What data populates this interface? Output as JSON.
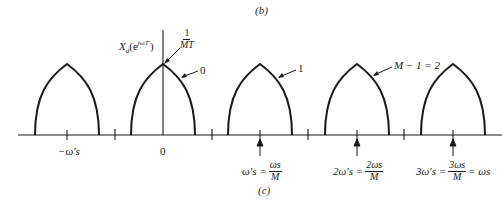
{
  "figure": {
    "top_caption": "(b)",
    "bottom_caption": "(c)",
    "y_axis_label": "X_d(e^{jωT'})",
    "y_axis_label_main": "X",
    "y_axis_label_sub": "d",
    "y_axis_label_arg": "(e",
    "y_axis_label_sup": "jωT'",
    "y_axis_label_close": ")",
    "peak_value_num": "1",
    "peak_value_den": "MT",
    "lobe_labels": [
      "0",
      "1",
      "M − 1 = 2"
    ],
    "x_labels": {
      "neg_ws": "−ω′s",
      "zero": "0",
      "ws_lhs": "ω′s =",
      "ws_num": "ωs",
      "ws_den": "M",
      "two_ws_lhs": "2ω′s =",
      "two_ws_num": "2ωs",
      "two_ws_den": "M",
      "three_ws_lhs": "3ω′s =",
      "three_ws_num": "3ωs",
      "three_ws_den": "M",
      "three_ws_rhs": "= ωs"
    },
    "colors": {
      "line": "#1a1a1a",
      "background": "#ffffff"
    }
  }
}
